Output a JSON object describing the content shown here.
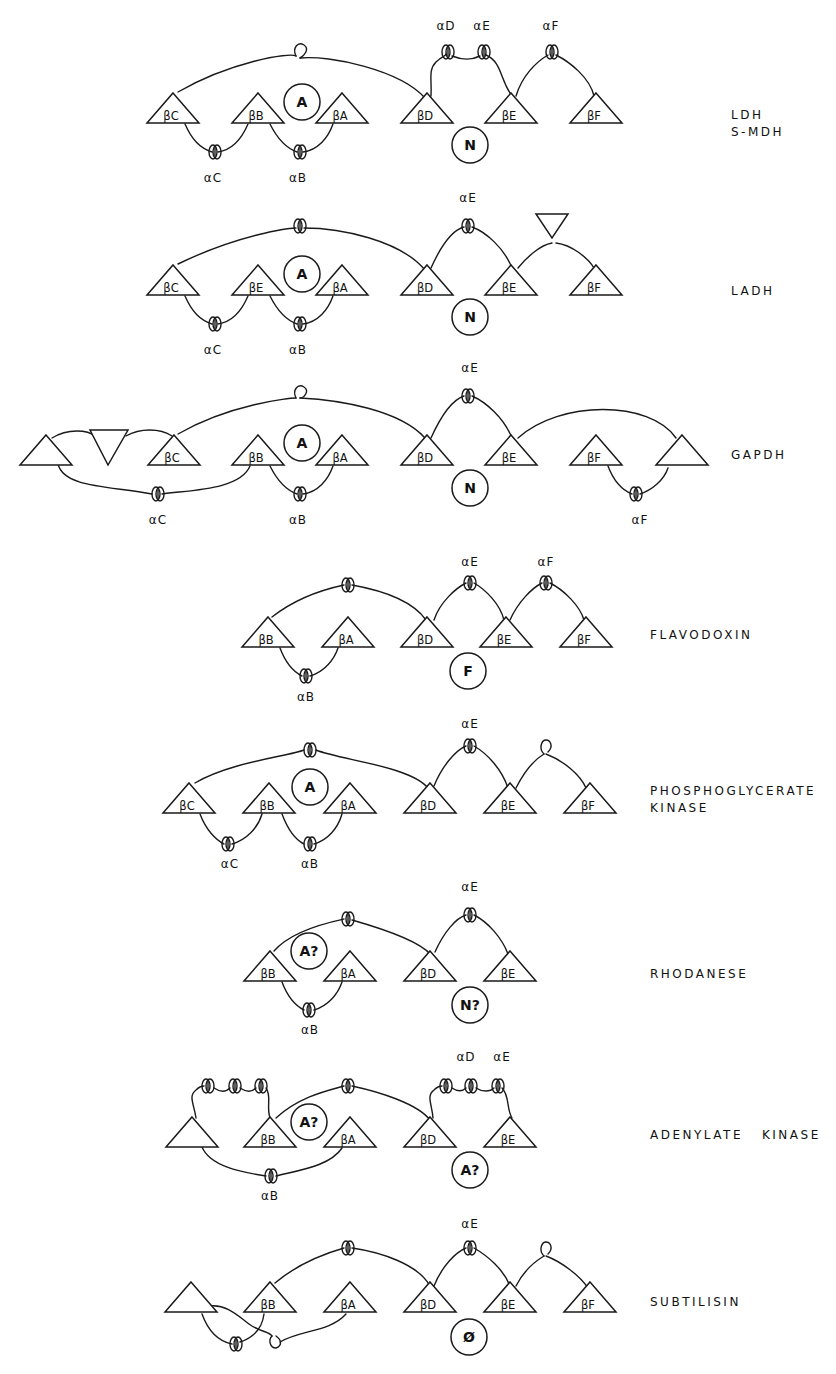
{
  "figure": {
    "ink_color": "#1a1a1a",
    "background": "#ffffff"
  },
  "proteins": [
    {
      "name": "LDH\nS-MDH",
      "label_pos": [
        731,
        115
      ],
      "strands": [
        {
          "label": "βC",
          "x": 173,
          "y": 123
        },
        {
          "label": "βB",
          "x": 258,
          "y": 123
        },
        {
          "label": "βA",
          "x": 342,
          "y": 123
        },
        {
          "label": "βD",
          "x": 427,
          "y": 123
        },
        {
          "label": "βE",
          "x": 511,
          "y": 123
        },
        {
          "label": "βF",
          "x": 596,
          "y": 123
        }
      ],
      "domains": [
        {
          "label": "A",
          "x": 302,
          "y": 102
        },
        {
          "label": "N",
          "x": 470,
          "y": 145
        }
      ],
      "helix_labels": [
        {
          "text": "αC",
          "x": 213,
          "y": 182
        },
        {
          "text": "αB",
          "x": 298,
          "y": 182
        },
        {
          "text": "αD",
          "x": 446,
          "y": 30
        },
        {
          "text": "αE",
          "x": 482,
          "y": 30
        },
        {
          "text": "αF",
          "x": 551,
          "y": 30
        }
      ]
    },
    {
      "name": "LADH",
      "label_pos": [
        731,
        291
      ],
      "strands": [
        {
          "label": "βC",
          "x": 173,
          "y": 295
        },
        {
          "label": "βE",
          "x": 258,
          "y": 295
        },
        {
          "label": "βA",
          "x": 342,
          "y": 295
        },
        {
          "label": "βD",
          "x": 427,
          "y": 295
        },
        {
          "label": "βE",
          "x": 511,
          "y": 295
        },
        {
          "label": "βF",
          "x": 596,
          "y": 295
        }
      ],
      "domains": [
        {
          "label": "A",
          "x": 302,
          "y": 274
        },
        {
          "label": "N",
          "x": 470,
          "y": 317
        }
      ],
      "helix_labels": [
        {
          "text": "αC",
          "x": 213,
          "y": 354
        },
        {
          "text": "αB",
          "x": 298,
          "y": 354
        },
        {
          "text": "αE",
          "x": 468,
          "y": 202
        }
      ]
    },
    {
      "name": "GAPDH",
      "label_pos": [
        731,
        455
      ],
      "strands": [
        {
          "label": "",
          "x": 46,
          "y": 465
        },
        {
          "label": "βC",
          "x": 174,
          "y": 465
        },
        {
          "label": "βB",
          "x": 258,
          "y": 465
        },
        {
          "label": "βA",
          "x": 342,
          "y": 465
        },
        {
          "label": "βD",
          "x": 427,
          "y": 465
        },
        {
          "label": "βE",
          "x": 511,
          "y": 465
        },
        {
          "label": "βF",
          "x": 596,
          "y": 465
        },
        {
          "label": "",
          "x": 682,
          "y": 465
        }
      ],
      "domains": [
        {
          "label": "A",
          "x": 302,
          "y": 443
        },
        {
          "label": "N",
          "x": 470,
          "y": 488
        }
      ],
      "helix_labels": [
        {
          "text": "αC",
          "x": 158,
          "y": 524
        },
        {
          "text": "αB",
          "x": 298,
          "y": 524
        },
        {
          "text": "αE",
          "x": 470,
          "y": 372
        },
        {
          "text": "αF",
          "x": 640,
          "y": 524
        }
      ]
    },
    {
      "name": "FLAVODOXIN",
      "label_pos": [
        650,
        635
      ],
      "strands": [
        {
          "label": "βB",
          "x": 268,
          "y": 647
        },
        {
          "label": "βA",
          "x": 348,
          "y": 647
        },
        {
          "label": "βD",
          "x": 427,
          "y": 647
        },
        {
          "label": "βE",
          "x": 506,
          "y": 647
        },
        {
          "label": "βF",
          "x": 586,
          "y": 647
        }
      ],
      "domains": [
        {
          "label": "F",
          "x": 468,
          "y": 671
        }
      ],
      "helix_labels": [
        {
          "text": "αB",
          "x": 306,
          "y": 701
        },
        {
          "text": "αE",
          "x": 470,
          "y": 566
        },
        {
          "text": "αF",
          "x": 546,
          "y": 566
        }
      ]
    },
    {
      "name": "PHOSPHOGLYCERATE\nKINASE",
      "label_pos": [
        650,
        791
      ],
      "strands": [
        {
          "label": "βC",
          "x": 189,
          "y": 813
        },
        {
          "label": "βB",
          "x": 269,
          "y": 813
        },
        {
          "label": "βA",
          "x": 350,
          "y": 813
        },
        {
          "label": "βD",
          "x": 430,
          "y": 813
        },
        {
          "label": "βE",
          "x": 510,
          "y": 813
        },
        {
          "label": "βF",
          "x": 590,
          "y": 813
        }
      ],
      "domains": [
        {
          "label": "A",
          "x": 310,
          "y": 787
        }
      ],
      "helix_labels": [
        {
          "text": "αC",
          "x": 230,
          "y": 868
        },
        {
          "text": "αB",
          "x": 310,
          "y": 868
        },
        {
          "text": "αE",
          "x": 470,
          "y": 728
        }
      ]
    },
    {
      "name": "RHODANESE",
      "label_pos": [
        650,
        974
      ],
      "strands": [
        {
          "label": "βB",
          "x": 270,
          "y": 981
        },
        {
          "label": "βA",
          "x": 350,
          "y": 981
        },
        {
          "label": "βD",
          "x": 430,
          "y": 981
        },
        {
          "label": "βE",
          "x": 510,
          "y": 981
        }
      ],
      "domains": [
        {
          "label": "A?",
          "x": 309,
          "y": 951
        },
        {
          "label": "N?",
          "x": 470,
          "y": 1005
        }
      ],
      "helix_labels": [
        {
          "text": "αB",
          "x": 310,
          "y": 1034
        },
        {
          "text": "αE",
          "x": 470,
          "y": 891
        }
      ]
    },
    {
      "name": "ADENYLATE   KINASE",
      "label_pos": [
        650,
        1135
      ],
      "strands": [
        {
          "label": "",
          "x": 192,
          "y": 1147
        },
        {
          "label": "βB",
          "x": 270,
          "y": 1147
        },
        {
          "label": "βA",
          "x": 350,
          "y": 1147
        },
        {
          "label": "βD",
          "x": 430,
          "y": 1147
        },
        {
          "label": "βE",
          "x": 510,
          "y": 1147
        }
      ],
      "domains": [
        {
          "label": "A?",
          "x": 309,
          "y": 1122
        },
        {
          "label": "A?",
          "x": 470,
          "y": 1170
        }
      ],
      "helix_labels": [
        {
          "text": "αB",
          "x": 270,
          "y": 1200
        },
        {
          "text": "αD",
          "x": 466,
          "y": 1061
        },
        {
          "text": "αE",
          "x": 502,
          "y": 1061
        }
      ]
    },
    {
      "name": "SUBTILISIN",
      "label_pos": [
        650,
        1302
      ],
      "strands": [
        {
          "label": "",
          "x": 191,
          "y": 1312
        },
        {
          "label": "βB",
          "x": 270,
          "y": 1312
        },
        {
          "label": "βA",
          "x": 350,
          "y": 1312
        },
        {
          "label": "βD",
          "x": 430,
          "y": 1312
        },
        {
          "label": "βE",
          "x": 510,
          "y": 1312
        },
        {
          "label": "βF",
          "x": 590,
          "y": 1312
        }
      ],
      "domains": [
        {
          "label": "Ø",
          "x": 469,
          "y": 1337
        }
      ],
      "helix_labels": [
        {
          "text": "αE",
          "x": 470,
          "y": 1228
        }
      ]
    }
  ]
}
